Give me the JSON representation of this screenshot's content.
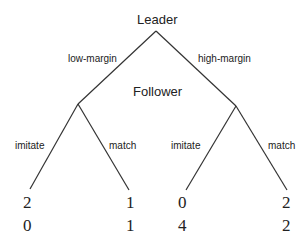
{
  "root": {
    "label": "Leader"
  },
  "follower": {
    "label": "Follower"
  },
  "leader_actions": [
    "low-margin",
    "high-margin"
  ],
  "follower_actions": {
    "left": [
      "imitate",
      "match"
    ],
    "right": [
      "imitate",
      "match"
    ]
  },
  "payoffs": [
    {
      "leader": "2",
      "follower": "0"
    },
    {
      "leader": "1",
      "follower": "1"
    },
    {
      "leader": "0",
      "follower": "4"
    },
    {
      "leader": "2",
      "follower": "2"
    }
  ]
}
